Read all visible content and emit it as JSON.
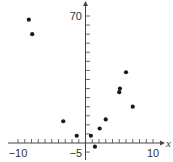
{
  "chart_data": {
    "type": "scatter",
    "title": "",
    "xlabel": "x",
    "ylabel": "y",
    "xlim": [
      -10,
      10
    ],
    "ylim": [
      -5,
      70
    ],
    "x_ticks_labeled": [
      -10,
      10
    ],
    "y_ticks_labeled": [
      -5,
      70
    ],
    "x_tick_step": 1,
    "y_tick_step": 5,
    "grid": false,
    "legend": null,
    "points": [
      {
        "x": -8.4,
        "y": 68
      },
      {
        "x": -7.9,
        "y": 60
      },
      {
        "x": -3.3,
        "y": 12
      },
      {
        "x": -1.3,
        "y": 4
      },
      {
        "x": 0.8,
        "y": 4
      },
      {
        "x": 1.4,
        "y": -2
      },
      {
        "x": 2.1,
        "y": 8
      },
      {
        "x": 3.0,
        "y": 13
      },
      {
        "x": 5.0,
        "y": 28
      },
      {
        "x": 5.1,
        "y": 30
      },
      {
        "x": 6.0,
        "y": 39
      },
      {
        "x": 7.0,
        "y": 20
      }
    ]
  },
  "labels": {
    "x_axis": "x",
    "y_axis": "y",
    "x_neg10": "−10",
    "x_pos10": "10",
    "y_neg5": "−5",
    "y_70": "70"
  },
  "colors": {
    "axis": "#444444",
    "point": "#1a1a1a"
  }
}
